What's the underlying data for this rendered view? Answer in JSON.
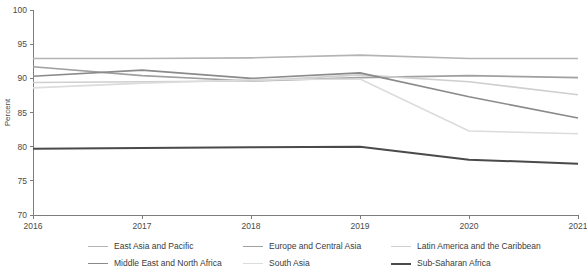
{
  "chart_data": {
    "type": "line",
    "title": "",
    "subtitle": "",
    "xlabel": "",
    "ylabel": "Percent",
    "x": [
      2016,
      2017,
      2018,
      2019,
      2020,
      2021
    ],
    "xtick_labels": [
      "2016",
      "2017",
      "2018",
      "2019",
      "2020",
      "2021"
    ],
    "xlim": [
      2016,
      2021
    ],
    "ylim": [
      70,
      100
    ],
    "ytick_labels": [
      "70",
      "75",
      "80",
      "85",
      "90",
      "95",
      "100"
    ],
    "ytick_values": [
      70,
      75,
      80,
      85,
      90,
      95,
      100
    ],
    "grid": false,
    "legend_position": "bottom",
    "series": [
      {
        "name": "East Asia and Pacific",
        "color": "#b4b4b4",
        "width": 1.6,
        "values": [
          92.9,
          92.9,
          93.0,
          93.4,
          92.9,
          92.9
        ]
      },
      {
        "name": "Europe and Central Asia",
        "color": "#a0a0a0",
        "width": 1.6,
        "values": [
          91.7,
          90.4,
          89.6,
          90.1,
          90.4,
          90.1
        ]
      },
      {
        "name": "Latin America and the Caribbean",
        "color": "#cfcfcf",
        "width": 1.6,
        "values": [
          89.4,
          89.5,
          89.6,
          90.5,
          89.5,
          87.6
        ]
      },
      {
        "name": "Middle East and North Africa",
        "color": "#8a8a8a",
        "width": 1.6,
        "values": [
          90.3,
          91.2,
          90.0,
          90.8,
          87.3,
          84.2
        ]
      },
      {
        "name": "South Asia",
        "color": "#dcdcdc",
        "width": 1.6,
        "values": [
          88.6,
          89.3,
          89.8,
          89.9,
          82.3,
          81.9
        ]
      },
      {
        "name": "Sub-Saharan Africa",
        "color": "#4a4a4a",
        "width": 2.0,
        "values": [
          79.7,
          79.8,
          79.9,
          80.0,
          78.1,
          77.5
        ]
      }
    ]
  },
  "legend": {
    "items": [
      {
        "label": "East Asia and Pacific",
        "color": "#b4b4b4"
      },
      {
        "label": "Europe and Central Asia",
        "color": "#a0a0a0"
      },
      {
        "label": "Latin America and the Caribbean",
        "color": "#cfcfcf"
      },
      {
        "label": "Middle East and North Africa",
        "color": "#8a8a8a"
      },
      {
        "label": "South Asia",
        "color": "#dcdcdc"
      },
      {
        "label": "Sub-Saharan Africa",
        "color": "#4a4a4a"
      }
    ]
  }
}
